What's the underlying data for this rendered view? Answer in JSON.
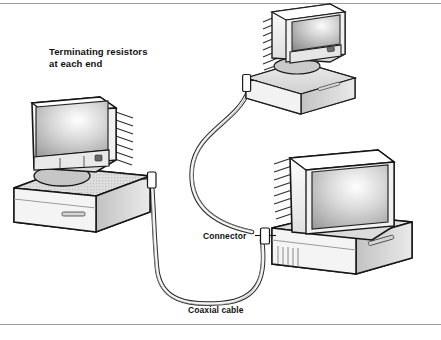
{
  "figure": {
    "type": "network-topology-diagram",
    "topology": "bus",
    "media": "coaxial cable (10Base2 / thin Ethernet)",
    "node_count": 3,
    "labels": {
      "terminating_resistors_line1": "Terminating resistors",
      "terminating_resistors_line2": "at each end",
      "connector": "Connector",
      "coaxial_cable": "Coaxial cable"
    },
    "nodes": [
      {
        "id": "computer-left",
        "description": "desktop computer with CRT monitor, three-quarter view facing right",
        "has_connector": true,
        "connector_side": "rear-right of case"
      },
      {
        "id": "computer-top-right",
        "description": "desktop computer with CRT monitor, partially cropped by top frame edge",
        "has_connector": true,
        "connector_side": "left of case"
      },
      {
        "id": "computer-right",
        "description": "desktop computer with CRT monitor, front view with vented monitor side",
        "has_connector": true,
        "connector_side": "left of case"
      }
    ],
    "cable_segments": [
      {
        "from": "computer-top-right",
        "to": "computer-right",
        "label": "Connector"
      },
      {
        "from": "computer-right",
        "to": "computer-left",
        "label": "Coaxial cable"
      }
    ],
    "colors": {
      "ink": "#111111",
      "rule": "#9a9a9a",
      "screen_light": "#f2f2f2",
      "screen_mid": "#a9a9a9",
      "screen_dark": "#7d7d7d",
      "case_light": "#f6f6f6",
      "case_mid": "#d8d8d8",
      "case_shade": "#bfbfbf",
      "background": "#ffffff"
    }
  }
}
